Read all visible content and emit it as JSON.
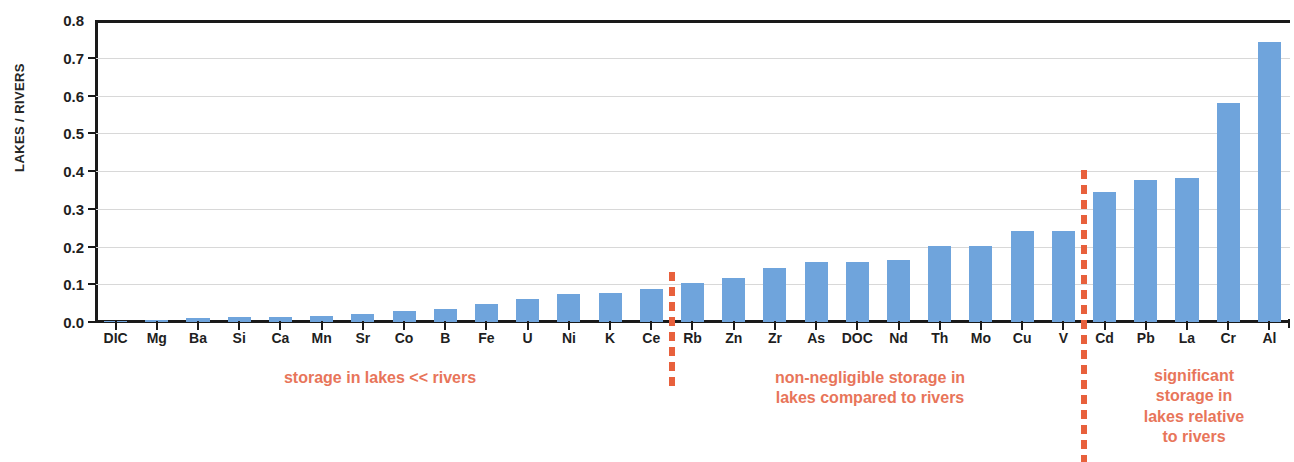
{
  "chart_data": {
    "type": "bar",
    "title": "",
    "xlabel": "",
    "ylabel": "LAKES / RIVERS",
    "ylim": [
      0.0,
      0.8
    ],
    "grid": true,
    "legend": "none",
    "bar_color": "#6fa4dc",
    "annotation_color": "#e8755a",
    "axis_color": "#1a1a1a",
    "ytick_labels": [
      "0.8",
      "0.7",
      "0.6",
      "0.5",
      "0.4",
      "0.3",
      "0.2",
      "0.1",
      "0.0"
    ],
    "ytick_values": [
      0.8,
      0.7,
      0.6,
      0.5,
      0.4,
      0.3,
      0.2,
      0.1,
      0.0
    ],
    "categories": [
      "DIC",
      "Mg",
      "Ba",
      "Si",
      "Ca",
      "Mn",
      "Sr",
      "Co",
      "B",
      "Fe",
      "U",
      "Ni",
      "K",
      "Ce",
      "Rb",
      "Zn",
      "Zr",
      "As",
      "DOC",
      "Nd",
      "Th",
      "Mo",
      "Cu",
      "V",
      "Cd",
      "Pb",
      "La",
      "Cr",
      "Al"
    ],
    "values": [
      0.004,
      0.006,
      0.011,
      0.012,
      0.012,
      0.015,
      0.021,
      0.028,
      0.035,
      0.047,
      0.06,
      0.073,
      0.077,
      0.088,
      0.104,
      0.116,
      0.143,
      0.158,
      0.159,
      0.164,
      0.201,
      0.201,
      0.241,
      0.241,
      0.345,
      0.375,
      0.381,
      0.58,
      0.742
    ],
    "dividers": [
      {
        "after_category": "Ce",
        "before_category": "Rb",
        "index": 14
      },
      {
        "after_category": "V",
        "before_category": "Cd",
        "index": 24
      }
    ],
    "annotations": [
      {
        "text": "storage in lakes << rivers",
        "region": "DIC-Ce"
      },
      {
        "text": "non-negligible storage in\nlakes compared to rivers",
        "region": "Rb-V"
      },
      {
        "text": "significant\nstorage in\nlakes relative\nto rivers",
        "region": "Cd-Al"
      }
    ]
  }
}
